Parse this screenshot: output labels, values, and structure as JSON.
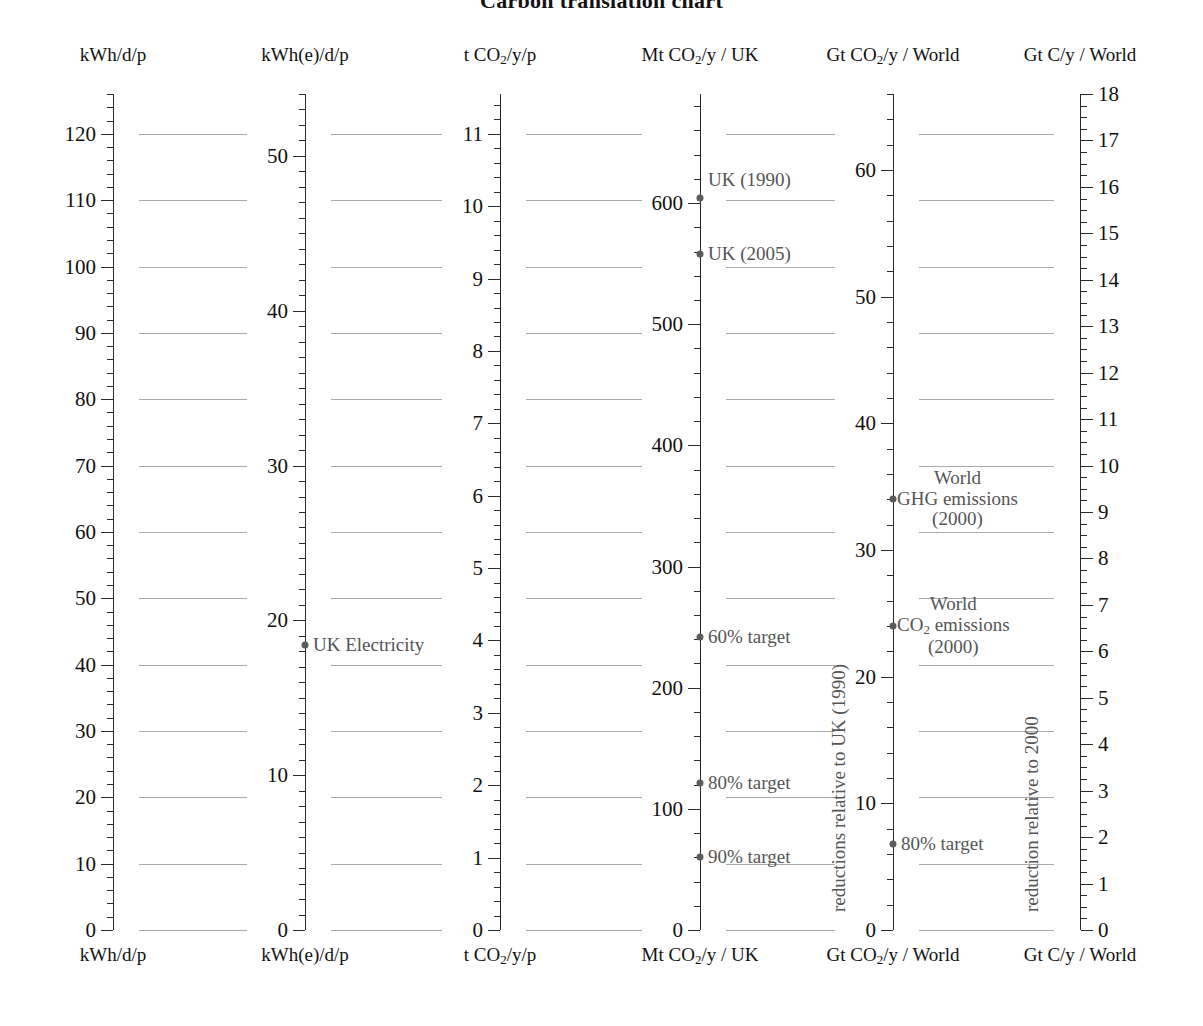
{
  "title": "Carbon translation chart",
  "columns": [
    {
      "id": "kwh-d-p",
      "header": "kWh/d/p",
      "footer": "kWh/d/p",
      "unit_html": "kWh/d/p",
      "axis_x": 113,
      "label_side": "left",
      "max": 126,
      "tick_labels": [
        0,
        10,
        20,
        30,
        40,
        50,
        60,
        70,
        80,
        90,
        100,
        110,
        120
      ],
      "minor_step": 2,
      "major_step": 10,
      "points": [],
      "point_labels": []
    },
    {
      "id": "kwhe-d-p",
      "header": "kWh(e)/d/p",
      "footer": "kWh(e)/d/p",
      "unit_html": "kWh(e)/d/p",
      "axis_x": 305,
      "label_side": "left",
      "max": 54,
      "tick_labels": [
        0,
        10,
        20,
        30,
        40,
        50
      ],
      "minor_step": 1,
      "major_step": 10,
      "points": [
        {
          "value": 18.4,
          "label": "UK Electricity",
          "label_side": "right"
        }
      ]
    },
    {
      "id": "tco2-y-p",
      "header": "tCO2/y/p",
      "footer": "tCO2/y/p",
      "unit_html": "t CO<sub>2</sub>/y/p",
      "axis_x": 500,
      "label_side": "left",
      "max": 11.55,
      "tick_labels": [
        0,
        1,
        2,
        3,
        4,
        5,
        6,
        7,
        8,
        9,
        10,
        11
      ],
      "minor_step": 0.2,
      "major_step": 1,
      "points": []
    },
    {
      "id": "mtco2-y-uk",
      "header": "MtCO2/y / UK",
      "footer": "MtCO2/y / UK",
      "unit_html": "Mt CO<sub>2</sub>/y / UK",
      "axis_x": 700,
      "label_side": "left",
      "max": 690,
      "tick_labels": [
        0,
        100,
        200,
        300,
        400,
        500,
        600
      ],
      "minor_step": 20,
      "major_step": 100,
      "points": [
        {
          "value": 604,
          "label": "UK (1990)",
          "label_side": "right",
          "label_offset": -18
        },
        {
          "value": 558,
          "label": "UK (2005)",
          "label_side": "right",
          "label_offset": 0
        },
        {
          "value": 242,
          "label": "60% target",
          "label_side": "right"
        },
        {
          "value": 121,
          "label": "80% target",
          "label_side": "right"
        },
        {
          "value": 60,
          "label": "90% target",
          "label_side": "right"
        }
      ],
      "rotated_label": "reductions relative to UK (1990)"
    },
    {
      "id": "gtco2-y-world",
      "header": "GtCO2/y / World",
      "footer": "GtCO2/y / World",
      "unit_html": "Gt CO<sub>2</sub>/y / World",
      "axis_x": 893,
      "label_side": "left",
      "max": 66,
      "tick_labels": [
        0,
        10,
        20,
        30,
        40,
        50,
        60
      ],
      "minor_step": 2,
      "major_step": 10,
      "points": [
        {
          "value": 34,
          "label": "World\nGHG emissions\n(2000)",
          "label_side": "right"
        },
        {
          "value": 24,
          "label": "World\nCO2 emissions\n(2000)",
          "label_side": "right"
        },
        {
          "value": 6.8,
          "label": "80% target",
          "label_side": "right"
        }
      ],
      "rotated_label": "reduction relative to 2000"
    },
    {
      "id": "gtc-y-world",
      "header": "GtC/y / World",
      "footer": "GtC/y / World",
      "unit_html": "Gt C/y / World",
      "axis_x": 1080,
      "label_side": "right",
      "max": 18,
      "tick_labels": [
        0,
        1,
        2,
        3,
        4,
        5,
        6,
        7,
        8,
        9,
        10,
        11,
        12,
        13,
        14,
        15,
        16,
        17,
        18
      ],
      "minor_step": 0.25,
      "major_step": 1,
      "points": []
    }
  ],
  "connectors": {
    "note": "horizontal grey rules linking equivalent values across scales",
    "values_kwh": [
      0,
      10,
      20,
      30,
      40,
      50,
      60,
      70,
      80,
      90,
      100,
      110,
      120
    ]
  },
  "chart_data": {
    "type": "table",
    "title": "Carbon translation chart",
    "xlabel": "",
    "ylabel": "",
    "grid": true,
    "legend": "none",
    "scales": [
      {
        "name": "kWh/d/p",
        "min": 0,
        "max": 126,
        "ticks": [
          0,
          10,
          20,
          30,
          40,
          50,
          60,
          70,
          80,
          90,
          100,
          110,
          120
        ]
      },
      {
        "name": "kWh(e)/d/p",
        "min": 0,
        "max": 54,
        "ticks": [
          0,
          10,
          20,
          30,
          40,
          50
        ]
      },
      {
        "name": "tCO2/y/p",
        "min": 0,
        "max": 11.55,
        "ticks": [
          0,
          1,
          2,
          3,
          4,
          5,
          6,
          7,
          8,
          9,
          10,
          11
        ]
      },
      {
        "name": "MtCO2/y / UK",
        "min": 0,
        "max": 690,
        "ticks": [
          0,
          100,
          200,
          300,
          400,
          500,
          600
        ]
      },
      {
        "name": "GtCO2/y / World",
        "min": 0,
        "max": 66,
        "ticks": [
          0,
          10,
          20,
          30,
          40,
          50,
          60
        ]
      },
      {
        "name": "GtC/y / World",
        "min": 0,
        "max": 18,
        "ticks": [
          0,
          1,
          2,
          3,
          4,
          5,
          6,
          7,
          8,
          9,
          10,
          11,
          12,
          13,
          14,
          15,
          16,
          17,
          18
        ]
      }
    ],
    "annotations": [
      {
        "scale": "kWh(e)/d/p",
        "label": "UK Electricity",
        "value": 18.4
      },
      {
        "scale": "MtCO2/y / UK",
        "label": "UK (1990)",
        "value": 604
      },
      {
        "scale": "MtCO2/y / UK",
        "label": "UK (2005)",
        "value": 558
      },
      {
        "scale": "MtCO2/y / UK",
        "label": "60% target",
        "value": 242
      },
      {
        "scale": "MtCO2/y / UK",
        "label": "80% target",
        "value": 121
      },
      {
        "scale": "MtCO2/y / UK",
        "label": "90% target",
        "value": 60
      },
      {
        "scale": "GtCO2/y / World",
        "label": "World GHG emissions (2000)",
        "value": 34
      },
      {
        "scale": "GtCO2/y / World",
        "label": "World CO2 emissions (2000)",
        "value": 24
      },
      {
        "scale": "GtCO2/y / World",
        "label": "80% target",
        "value": 6.8
      }
    ],
    "axis_annotations": [
      {
        "scale": "MtCO2/y / UK",
        "text": "reductions relative to UK (1990)"
      },
      {
        "scale": "GtCO2/y / World",
        "text": "reduction relative to 2000"
      }
    ]
  }
}
